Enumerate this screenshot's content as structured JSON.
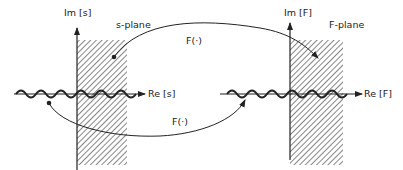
{
  "diagram": {
    "left_plane": {
      "name": "s-plane",
      "im_axis_label": "Im [s]",
      "re_axis_label": "Re [s]"
    },
    "right_plane": {
      "name": "F-plane",
      "im_axis_label": "Im [F]",
      "re_axis_label": "Re [F]"
    },
    "mappings": [
      {
        "label": "F(·)",
        "from": "point in shaded region of s-plane",
        "to": "point in shaded region of F-plane"
      },
      {
        "label": "F(·)",
        "from": "point near real axis of s-plane",
        "to": "point near real axis of F-plane"
      }
    ],
    "colors": {
      "ink": "#222222",
      "background": "#ffffff"
    }
  }
}
